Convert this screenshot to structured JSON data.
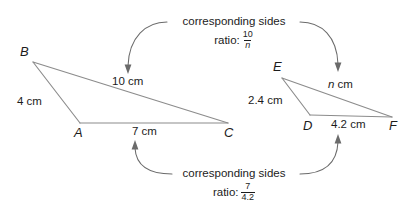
{
  "diagram": {
    "type": "similar-triangles-comparison",
    "triangle_left": {
      "name": "ABC",
      "vertices": [
        {
          "label": "B",
          "x": 33,
          "y": 62
        },
        {
          "label": "A",
          "x": 80,
          "y": 123
        },
        {
          "label": "C",
          "x": 228,
          "y": 123
        }
      ],
      "sides": [
        {
          "from": "B",
          "to": "A",
          "label": "4 cm",
          "value": 4,
          "unit": "cm"
        },
        {
          "from": "B",
          "to": "C",
          "label": "10 cm",
          "value": 10,
          "unit": "cm"
        },
        {
          "from": "A",
          "to": "C",
          "label": "7 cm",
          "value": 7,
          "unit": "cm"
        }
      ]
    },
    "triangle_right": {
      "name": "DEF",
      "vertices": [
        {
          "label": "E",
          "x": 282,
          "y": 78
        },
        {
          "label": "D",
          "x": 310,
          "y": 115
        },
        {
          "label": "F",
          "x": 392,
          "y": 117
        }
      ],
      "sides": [
        {
          "from": "E",
          "to": "D",
          "label": "2.4 cm",
          "value": 2.4,
          "unit": "cm"
        },
        {
          "from": "E",
          "to": "F",
          "label_var": "n",
          "label_unit": "cm",
          "value": null,
          "unit": "cm"
        },
        {
          "from": "D",
          "to": "F",
          "label": "4.2 cm",
          "value": 4.2,
          "unit": "cm"
        }
      ]
    },
    "callout_top": {
      "text": "corresponding sides",
      "ratio_word": "ratio:",
      "numerator": "10",
      "denominator": "n",
      "denominator_italic": true,
      "links": [
        "10 cm",
        "n cm"
      ]
    },
    "callout_bottom": {
      "text": "corresponding sides",
      "ratio_word": "ratio:",
      "numerator": "7",
      "denominator": "4.2",
      "denominator_italic": false,
      "links": [
        "7 cm",
        "4.2 cm"
      ]
    },
    "colors": {
      "stroke": "#8c8c8c",
      "arrow": "#6b6b6b",
      "text": "#1c1c1c",
      "background": "#ffffff"
    }
  }
}
